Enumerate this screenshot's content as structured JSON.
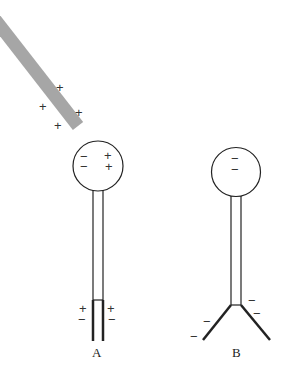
{
  "colors": {
    "rod": "#a6a6a6",
    "stroke": "#222222",
    "background": "#ffffff"
  },
  "rod": {
    "label": "charged rod",
    "charge_sign": "+",
    "charges": [
      "+",
      "+",
      "+",
      "+"
    ]
  },
  "electroscopes": [
    {
      "label": "A",
      "knob_charges": [
        "−",
        "−",
        "+",
        "+"
      ],
      "leaf_charges": [
        "+",
        "−",
        "+",
        "−"
      ],
      "state": "leaves closed"
    },
    {
      "label": "B",
      "knob_charges": [
        "−",
        "−"
      ],
      "leaf_charges": [
        "−",
        "−",
        "−",
        "−"
      ],
      "state": "leaves diverged"
    }
  ]
}
